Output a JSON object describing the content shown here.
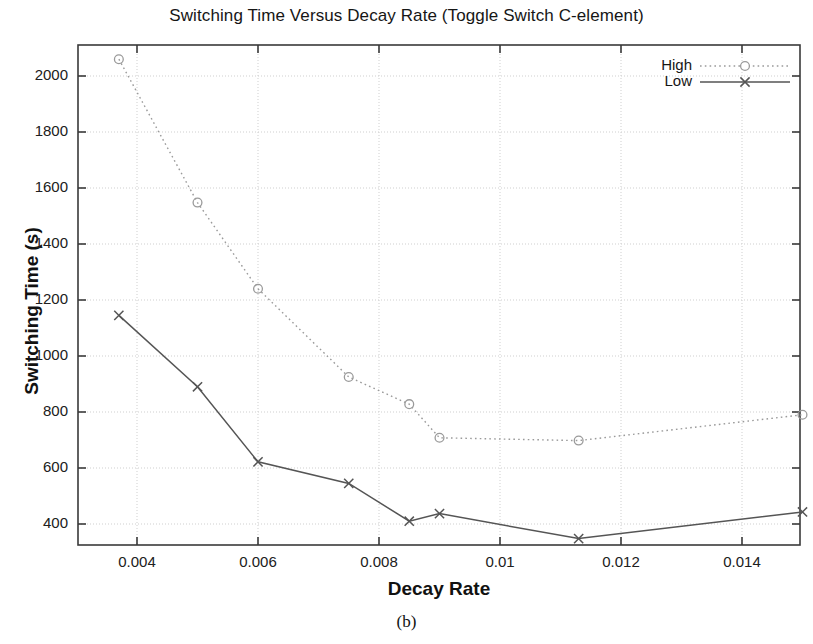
{
  "figure": {
    "title": "Switching Time Versus Decay Rate (Toggle Switch C-element)",
    "subcaption": "(b)",
    "xlabel": "Decay Rate",
    "ylabel": "Switching Time (s)"
  },
  "legend": {
    "position": "top-right",
    "entries": [
      {
        "label": "High",
        "marker": "open-circle",
        "line": "dotted",
        "color": "#9a9a9a"
      },
      {
        "label": "Low",
        "marker": "cross-x",
        "line": "solid",
        "color": "#555555"
      }
    ]
  },
  "axes": {
    "x_ticks": [
      "0.004",
      "0.006",
      "0.008",
      "0.01",
      "0.012",
      "0.014"
    ],
    "y_ticks": [
      "400",
      "600",
      "800",
      "1000",
      "1200",
      "1400",
      "1600",
      "1800",
      "2000"
    ]
  },
  "chart_data": {
    "type": "line",
    "title": "Switching Time Versus Decay Rate (Toggle Switch C-element)",
    "xlabel": "Decay Rate",
    "ylabel": "Switching Time (s)",
    "xlim": [
      0.00302,
      0.01496
    ],
    "ylim": [
      344,
      2095
    ],
    "xticks": [
      0.004,
      0.006,
      0.008,
      0.01,
      0.012,
      0.014
    ],
    "yticks": [
      400,
      600,
      800,
      1000,
      1200,
      1400,
      1600,
      1800,
      2000
    ],
    "grid": true,
    "legend_position": "top right",
    "series": [
      {
        "name": "High",
        "marker": "open-circle",
        "linestyle": "dotted",
        "color": "#9a9a9a",
        "points": [
          {
            "x": 0.0037,
            "y": 2060
          },
          {
            "x": 0.005,
            "y": 1548
          },
          {
            "x": 0.006,
            "y": 1240
          },
          {
            "x": 0.0075,
            "y": 925
          },
          {
            "x": 0.0085,
            "y": 828
          },
          {
            "x": 0.009,
            "y": 708
          },
          {
            "x": 0.0113,
            "y": 698
          },
          {
            "x": 0.015,
            "y": 790
          }
        ]
      },
      {
        "name": "Low",
        "marker": "cross-x",
        "linestyle": "solid",
        "color": "#555555",
        "points": [
          {
            "x": 0.0037,
            "y": 1145
          },
          {
            "x": 0.005,
            "y": 890
          },
          {
            "x": 0.006,
            "y": 622
          },
          {
            "x": 0.0075,
            "y": 545
          },
          {
            "x": 0.0085,
            "y": 410
          },
          {
            "x": 0.009,
            "y": 437
          },
          {
            "x": 0.0113,
            "y": 348
          },
          {
            "x": 0.015,
            "y": 443
          }
        ]
      }
    ]
  },
  "colors": {
    "axis": "#3a3a3a",
    "grid": "#cfcfcf",
    "high": "#9a9a9a",
    "low": "#555555",
    "text": "#161616"
  }
}
